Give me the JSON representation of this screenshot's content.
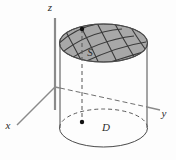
{
  "figure": {
    "caption_title": "Surface S over region D",
    "background_color": "#fdfdfd",
    "stroke_color": "#4a4a4a",
    "surface_fill_color": "#a8a8a8",
    "mesh_color": "#3a3a3a",
    "dash_color": "#555555",
    "point_color": "#111111"
  },
  "axes": {
    "z": {
      "label": "z",
      "x": 50,
      "y": 11
    },
    "y": {
      "label": "y",
      "x": 164,
      "y": 117
    },
    "x": {
      "label": "x",
      "x": 8,
      "y": 129
    }
  },
  "labels": {
    "surface": {
      "text": "S",
      "x": 90,
      "y": 56
    },
    "region": {
      "text": "D",
      "x": 106,
      "y": 131
    }
  },
  "geometry": {
    "origin": {
      "x": 55,
      "y": 87
    },
    "cylinder": {
      "left_wall_x": 60,
      "right_wall_x": 147,
      "top_center": {
        "x": 103.5,
        "y": 43
      },
      "bottom_center": {
        "x": 103.5,
        "y": 128
      },
      "radius_x": 44,
      "radius_y": 19
    },
    "vertical_dash": {
      "x": 82,
      "y_top": 29,
      "y_bottom": 122
    },
    "points": [
      {
        "name": "surface-point",
        "x": 82,
        "y": 29
      },
      {
        "name": "domain-point",
        "x": 82,
        "y": 122
      }
    ]
  }
}
